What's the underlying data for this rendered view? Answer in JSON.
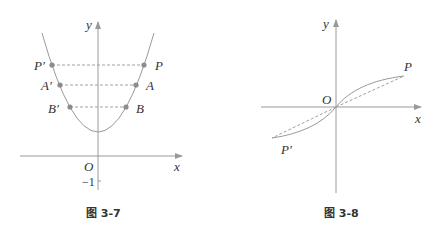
{
  "figures": [
    {
      "id": "fig-3-7",
      "caption": "图 3-7",
      "axis_labels": {
        "x": "x",
        "y": "y",
        "origin": "O"
      },
      "tick_labels": [
        "-1"
      ],
      "tick_text": "−1",
      "curve": "parabola opening upward, vertex on positive y-axis, symmetric about y-axis",
      "points": [
        {
          "name": "P",
          "label": "P"
        },
        {
          "name": "P'",
          "label": "P′"
        },
        {
          "name": "A",
          "label": "A"
        },
        {
          "name": "A'",
          "label": "A′"
        },
        {
          "name": "B",
          "label": "B"
        },
        {
          "name": "B'",
          "label": "B′"
        }
      ],
      "dashed_segments": [
        "P'P",
        "A'A",
        "B'B"
      ]
    },
    {
      "id": "fig-3-8",
      "caption": "图 3-8",
      "axis_labels": {
        "x": "x",
        "y": "y",
        "origin": "O"
      },
      "curve": "odd-function S-curve through origin, symmetric about origin",
      "points": [
        {
          "name": "P",
          "label": "P"
        },
        {
          "name": "P'",
          "label": "P′"
        }
      ],
      "dashed_segments": [
        "OP",
        "OP'"
      ]
    }
  ],
  "colors": {
    "axis": "#9a9a9a",
    "curve": "#9a9a9a",
    "point": "#8c8c8c",
    "dash": "#a0a0a0",
    "text": "#333333"
  }
}
